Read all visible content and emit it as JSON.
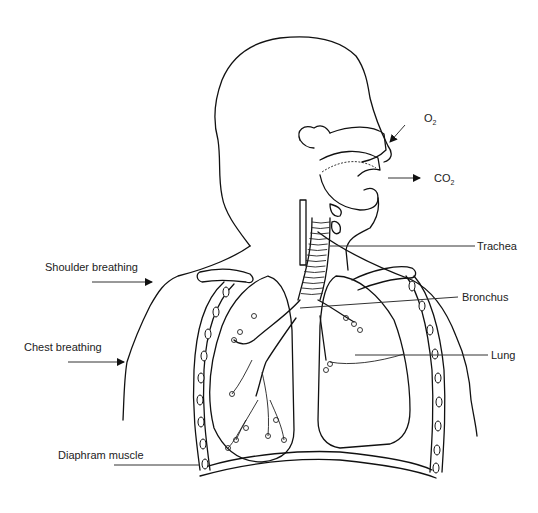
{
  "figure": {
    "labels": {
      "o2": {
        "main": "O",
        "sub": "2"
      },
      "co2": {
        "main": "CO",
        "sub": "2"
      },
      "trachea": "Trachea",
      "bronchus": "Bronchus",
      "lung": "Lung",
      "shoulder_breathing": "Shoulder breathing",
      "chest_breathing": "Chest breathing",
      "diaphragm_muscle": "Diaphram muscle"
    },
    "colors": {
      "line": "#111111",
      "background": "#ffffff",
      "text": "#222222"
    }
  }
}
